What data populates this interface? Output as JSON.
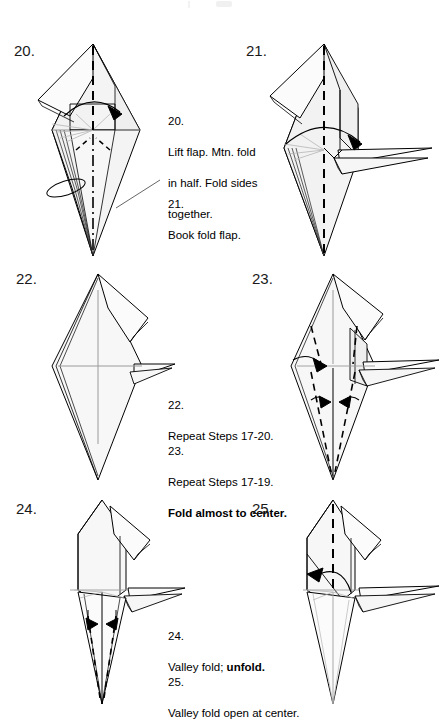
{
  "page": {
    "width": 440,
    "height": 709,
    "background": "#ffffff",
    "ink": "#000000",
    "paper_fill": "#f4f4f4",
    "crease_gray": "#9a9a9a"
  },
  "steps": [
    {
      "id": "step-20",
      "number_label": "20.",
      "number_x": 14,
      "number_y": 42,
      "diagram_x": 30,
      "diagram_y": 38,
      "diagram_w": 140,
      "diagram_h": 220
    },
    {
      "id": "step-21",
      "number_label": "21.",
      "number_x": 246,
      "number_y": 42,
      "diagram_x": 262,
      "diagram_y": 38,
      "diagram_w": 175,
      "diagram_h": 220
    },
    {
      "id": "step-22",
      "number_label": "22.",
      "number_x": 16,
      "number_y": 270,
      "diagram_x": 30,
      "diagram_y": 268,
      "diagram_w": 140,
      "diagram_h": 218
    },
    {
      "id": "step-23",
      "number_label": "23.",
      "number_x": 252,
      "number_y": 270,
      "diagram_x": 255,
      "diagram_y": 268,
      "diagram_w": 182,
      "diagram_h": 218
    },
    {
      "id": "step-24",
      "number_label": "24.",
      "number_x": 16,
      "number_y": 500,
      "diagram_x": 30,
      "diagram_y": 498,
      "diagram_w": 150,
      "diagram_h": 208
    },
    {
      "id": "step-25",
      "number_label": "25.",
      "number_x": 252,
      "number_y": 500,
      "diagram_x": 255,
      "diagram_y": 498,
      "diagram_w": 182,
      "diagram_h": 208
    }
  ],
  "captions": [
    {
      "id": "caption-20",
      "x": 168,
      "y": 98,
      "width": 104,
      "number": "20.",
      "line1": "Lift flap. Mtn. fold",
      "line2": "in half. Fold sides",
      "line3": "together.",
      "bold_tail": ""
    },
    {
      "id": "caption-21",
      "x": 168,
      "y": 181,
      "width": 104,
      "number": "21.",
      "line1": "Book fold flap.",
      "line2": "",
      "line3": "",
      "bold_tail": ""
    },
    {
      "id": "caption-22",
      "x": 168,
      "y": 382,
      "width": 124,
      "number": "22.",
      "line1": "Repeat Steps 17-20.",
      "line2": "",
      "line3": "",
      "bold_tail": ""
    },
    {
      "id": "caption-23",
      "x": 168,
      "y": 428,
      "width": 124,
      "number": "23.",
      "line1": "Repeat Steps 17-19.",
      "line2": "",
      "line3": "",
      "bold_tail": "Fold almost to center."
    },
    {
      "id": "caption-24",
      "x": 168,
      "y": 613,
      "width": 130,
      "number": "24.",
      "line1": "Valley fold; ",
      "line2": "",
      "line3": "",
      "bold_tail": "unfold."
    },
    {
      "id": "caption-25",
      "x": 168,
      "y": 659,
      "width": 140,
      "number": "25.",
      "line1": "Valley fold open at center.",
      "line2": "",
      "line3": "",
      "bold_tail": ""
    }
  ]
}
